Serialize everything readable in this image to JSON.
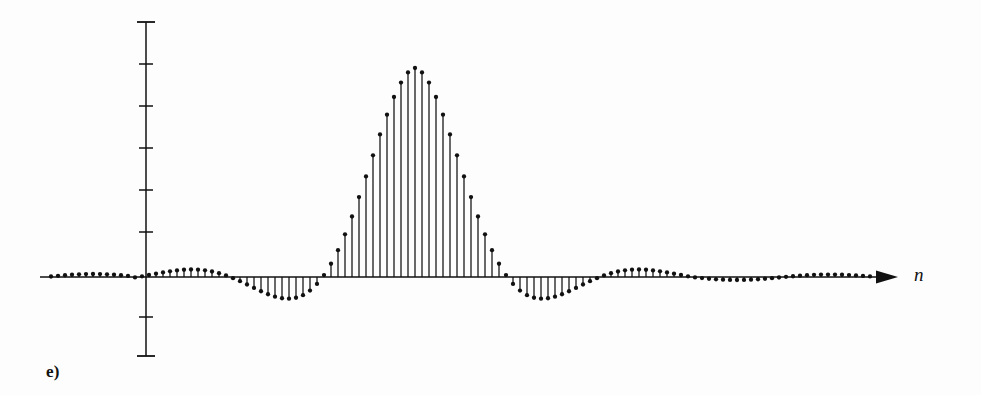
{
  "figure": {
    "subfigure_label": "e)",
    "xaxis_label": "n",
    "background_color": "#fdfdfd",
    "ink_color": "#111111"
  },
  "chart_data": {
    "type": "scatter",
    "style": "stem-plot",
    "title": "",
    "subtitle": "",
    "xlabel": "n",
    "ylabel": "",
    "grid": false,
    "legend": null,
    "annotations": [
      "e)"
    ],
    "axis": {
      "x_axis_drawn": true,
      "x_axis_arrow": true,
      "y_axis_drawn": true,
      "y_axis_ticks_count": 9,
      "y_axis_tick_labels": [],
      "x_axis_tick_labels": [],
      "x_origin_px": 146,
      "y_zero_px": 277,
      "x_axis_start_px": 40,
      "x_axis_end_px": 898,
      "y_axis_top_px": 22,
      "y_axis_bottom_px": 356,
      "y_tick_positions_px": [
        22,
        64,
        106,
        148,
        190,
        232,
        277,
        317,
        356
      ],
      "sample_spacing_px": 7.0,
      "first_sample_px": 48,
      "peak_sample_px": 415,
      "peak_value_px": 68,
      "unit_amplitude_px": 209
    },
    "x": [
      -52,
      -51,
      -50,
      -49,
      -48,
      -47,
      -46,
      -45,
      -44,
      -43,
      -42,
      -41,
      -40,
      -39,
      -38,
      -37,
      -36,
      -35,
      -34,
      -33,
      -32,
      -31,
      -30,
      -29,
      -28,
      -27,
      -26,
      -25,
      -24,
      -23,
      -22,
      -21,
      -20,
      -19,
      -18,
      -17,
      -16,
      -15,
      -14,
      -13,
      -12,
      -11,
      -10,
      -9,
      -8,
      -7,
      -6,
      -5,
      -4,
      -3,
      -2,
      -1,
      0,
      1,
      2,
      3,
      4,
      5,
      6,
      7,
      8,
      9,
      10,
      11,
      12,
      13,
      14,
      15,
      16,
      17,
      18,
      19,
      20,
      21,
      22,
      23,
      24,
      25,
      26,
      27,
      28,
      29,
      30,
      31,
      32,
      33,
      34,
      35,
      36,
      37,
      38,
      39,
      40,
      41,
      42,
      43,
      44,
      45,
      46,
      47,
      48,
      49,
      50,
      51,
      52,
      53,
      54,
      55,
      56,
      57,
      58,
      59,
      60,
      61,
      62,
      63,
      64,
      65
    ],
    "values": [
      0.012,
      0.014,
      0.013,
      0.011,
      0.009,
      0.008,
      0.01,
      0.013,
      0.015,
      0.014,
      0.011,
      0.008,
      0.007,
      0.009,
      0.013,
      0.016,
      0.016,
      0.013,
      0.009,
      0.007,
      0.008,
      0.012,
      0.017,
      0.019,
      0.017,
      0.012,
      0.008,
      0.007,
      0.011,
      0.018,
      0.023,
      0.024,
      0.02,
      0.013,
      0.009,
      0.012,
      0.022,
      0.035,
      0.046,
      0.052,
      0.05,
      0.041,
      0.028,
      0.016,
      0.005,
      -0.014,
      -0.037,
      -0.063,
      -0.087,
      -0.103,
      -0.108,
      -0.1,
      -0.078,
      -0.047,
      -0.012,
      0.02,
      0.045,
      0.063,
      0.076,
      0.087,
      0.1,
      0.0,
      0.0,
      0.0,
      0.0,
      0.0,
      0.0,
      0.0,
      0.0,
      0.0,
      0.0,
      0.0,
      0.0,
      0.0,
      0.0,
      0.0,
      0.0,
      0.0,
      0.0,
      0.0,
      0.0,
      0.0,
      0.0,
      0.0,
      0.0,
      0.0,
      0.0,
      0.0,
      0.0,
      0.0,
      0.0,
      0.0,
      0.0,
      0.0,
      0.0,
      0.0,
      0.0,
      0.0,
      0.0,
      0.0,
      0.0,
      0.0,
      0.0,
      0.0,
      0.0,
      0.0,
      0.0,
      0.0,
      0.0,
      0.0,
      0.0,
      0.0,
      0.0,
      0.0,
      0.0,
      0.0,
      0.0,
      0.0
    ],
    "main_lobe": {
      "center_index": 0,
      "peak_value": 1.0,
      "half_width_samples": 13,
      "shape": "raised-cosine / sinc main lobe"
    },
    "sidelobes": [
      {
        "side": "left",
        "polarity": "negative",
        "peak_magnitude": 0.108
      },
      {
        "side": "left",
        "polarity": "positive",
        "peak_magnitude": 0.052
      },
      {
        "side": "right",
        "polarity": "negative",
        "peak_magnitude": 0.108
      },
      {
        "side": "right",
        "polarity": "positive",
        "peak_magnitude": 0.052
      }
    ]
  }
}
